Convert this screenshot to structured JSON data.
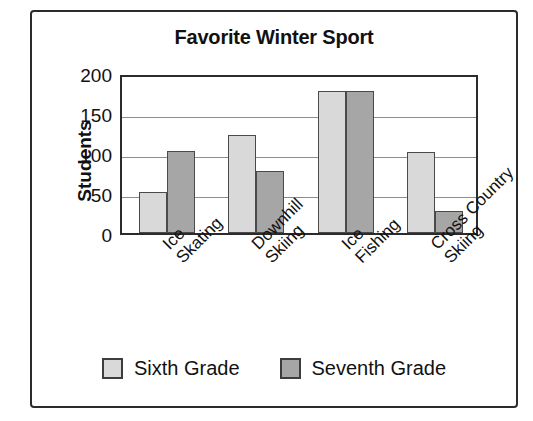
{
  "figure": {
    "title": "Favorite Winter Sport",
    "border_color": "#2b2b2b",
    "background": "#ffffff"
  },
  "chart_data": {
    "type": "bar",
    "title": "Favorite Winter Sport",
    "xlabel": "",
    "ylabel": "Students",
    "ylim": [
      0,
      200
    ],
    "yticks": [
      0,
      50,
      100,
      150,
      200
    ],
    "ytick_labels": [
      "0",
      "50",
      "100",
      "150",
      "200"
    ],
    "grid": "horizontal",
    "legend_position": "bottom",
    "categories": [
      "Ice Skating",
      "Downhill Skiing",
      "Ice Fishing",
      "Cross Country Skiing"
    ],
    "category_lines": [
      [
        "Ice",
        "Skating"
      ],
      [
        "Downhill",
        "Skiing"
      ],
      [
        "Ice",
        "Fishing"
      ],
      [
        "Cross Country",
        "Skiing"
      ]
    ],
    "series": [
      {
        "name": "Sixth Grade",
        "color": "#d9d9d9",
        "values": [
          51,
          123,
          177,
          101
        ]
      },
      {
        "name": "Seventh Grade",
        "color": "#a6a6a6",
        "values": [
          102,
          77,
          177,
          28
        ]
      }
    ]
  },
  "legend": {
    "items": [
      {
        "label": "Sixth Grade",
        "color": "#d9d9d9"
      },
      {
        "label": "Seventh Grade",
        "color": "#a6a6a6"
      }
    ]
  }
}
